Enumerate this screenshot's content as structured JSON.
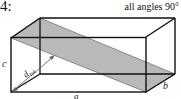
{
  "problem": {
    "number_label": "4:",
    "note": "all angles 90°"
  },
  "figure": {
    "type": "rectangular-box-with-diagonal-plane",
    "labels": {
      "a": "a",
      "b": "b",
      "c": "c",
      "diagonal": "d",
      "diagonal_sub": "tot"
    },
    "colors": {
      "edge": "#111111",
      "plane_fill": "#b9b9b9",
      "arrow": "#666666"
    }
  }
}
